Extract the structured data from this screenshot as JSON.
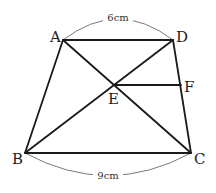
{
  "figure": {
    "type": "trapezoid",
    "vertices": {
      "A": "A",
      "B": "B",
      "C": "C",
      "D": "D",
      "E": "E",
      "F": "F"
    },
    "measurements": {
      "AD": "6cm",
      "BC": "9cm"
    },
    "segments": [
      "AD",
      "BC",
      "AB",
      "DC",
      "AC",
      "BD",
      "EF"
    ]
  },
  "colors": {
    "line": "#1a1a1a",
    "arc": "#555555"
  }
}
